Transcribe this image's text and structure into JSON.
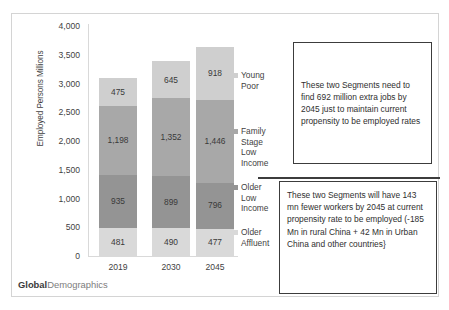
{
  "brand": {
    "bold_part": "Global",
    "light_part": "Demographics"
  },
  "legend": {
    "items": [
      {
        "label": "Young\nPoor",
        "color": "#cfcfcf"
      },
      {
        "label": "Family\nStage\nLow\nIncome",
        "color": "#a8a8a8"
      },
      {
        "label": "Older\nLow\nIncome",
        "color": "#949494"
      },
      {
        "label": "Older\nAffluent",
        "color": "#d9d9d9"
      }
    ]
  },
  "callouts": {
    "top": "These two Segments need to find 692 million extra jobs by 2045 just to maintain  current propensity to be employed rates",
    "bottom": "These two Segments will have 143 mn fewer workers by 2045 at current propensity rate to be employed  (-185 Mn in rural China + 42 Mn in Urban China and other countries}"
  },
  "chart_data": {
    "type": "bar",
    "stacked": true,
    "title": "",
    "xlabel": "",
    "ylabel": "Employed Persons Millions",
    "categories": [
      "2019",
      "2030",
      "2045"
    ],
    "ylim": [
      0,
      4000
    ],
    "yticks": [
      "0",
      "500",
      "1,000",
      "1,500",
      "2,000",
      "2,500",
      "3,000",
      "3,500",
      "4,000"
    ],
    "ytick_values": [
      0,
      500,
      1000,
      1500,
      2000,
      2500,
      3000,
      3500,
      4000
    ],
    "grid": false,
    "legend_position": "right",
    "series": [
      {
        "name": "Older Affluent",
        "color": "#d9d9d9",
        "values": [
          481,
          490,
          477
        ],
        "labels": [
          "481",
          "490",
          "477"
        ]
      },
      {
        "name": "Older Low Income",
        "color": "#949494",
        "values": [
          935,
          899,
          796
        ],
        "labels": [
          "935",
          "899",
          "796"
        ]
      },
      {
        "name": "Family Stage Low Income",
        "color": "#a8a8a8",
        "values": [
          1198,
          1352,
          1446
        ],
        "labels": [
          "1,198",
          "1,352",
          "1,446"
        ]
      },
      {
        "name": "Young Poor",
        "color": "#cfcfcf",
        "values": [
          475,
          645,
          918
        ],
        "labels": [
          "475",
          "645",
          "918"
        ]
      }
    ],
    "totals": [
      3089,
      3386,
      3637
    ]
  }
}
